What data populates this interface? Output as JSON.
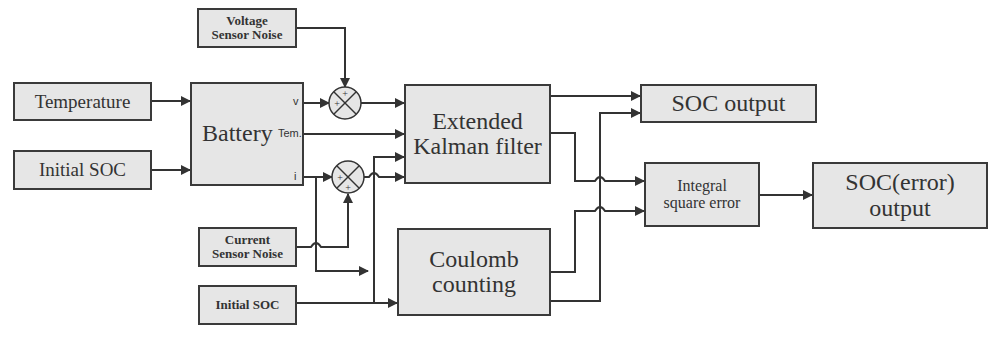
{
  "diagram": {
    "type": "block-diagram",
    "title_visible": false,
    "blocks": {
      "voltage_noise": {
        "line1": "Voltage",
        "line2": "Sensor Noise"
      },
      "temperature": {
        "label": "Temperature"
      },
      "initial_soc_top": {
        "label": "Initial SOC"
      },
      "battery": {
        "label": "Battery",
        "port_v": "v",
        "port_tem": "Tem.",
        "port_i": "i"
      },
      "ekf": {
        "line1": "Extended",
        "line2": "Kalman filter"
      },
      "current_noise": {
        "line1": "Current",
        "line2": "Sensor Noise"
      },
      "initial_soc_bottom": {
        "label": "Initial SOC"
      },
      "coulomb": {
        "line1": "Coulomb",
        "line2": "counting"
      },
      "soc_output": {
        "label": "SOC output"
      },
      "ise": {
        "line1": "Integral",
        "line2": "square error"
      },
      "soc_error_output": {
        "line1": "SOC(error)",
        "line2": "output"
      }
    },
    "summers": [
      {
        "id": "sum-voltage",
        "signs": [
          "+",
          "+"
        ]
      },
      {
        "id": "sum-current",
        "signs": [
          "+",
          "+"
        ]
      }
    ],
    "connections": [
      {
        "from": "Temperature",
        "to": "Battery"
      },
      {
        "from": "Initial SOC",
        "to": "Battery"
      },
      {
        "from": "Battery.v",
        "to": "sum-voltage"
      },
      {
        "from": "Voltage Sensor Noise",
        "to": "sum-voltage"
      },
      {
        "from": "sum-voltage",
        "to": "Extended Kalman filter"
      },
      {
        "from": "Battery.Tem.",
        "to": "Extended Kalman filter"
      },
      {
        "from": "Battery.i",
        "to": "sum-current"
      },
      {
        "from": "Current Sensor Noise",
        "to": "sum-current"
      },
      {
        "from": "sum-current",
        "to": "Extended Kalman filter"
      },
      {
        "from": "Battery.i",
        "to": "Coulomb counting"
      },
      {
        "from": "Initial SOC (bottom)",
        "to": "Coulomb counting"
      },
      {
        "from": "Initial SOC (bottom)",
        "to": "Extended Kalman filter"
      },
      {
        "from": "Extended Kalman filter",
        "to": "SOC output"
      },
      {
        "from": "Coulomb counting",
        "to": "SOC output"
      },
      {
        "from": "Extended Kalman filter",
        "to": "Integral square error"
      },
      {
        "from": "Coulomb counting",
        "to": "Integral square error"
      },
      {
        "from": "Integral square error",
        "to": "SOC(error) output"
      }
    ],
    "colors": {
      "block_fill": "#e6e6e6",
      "line": "#333333"
    }
  }
}
